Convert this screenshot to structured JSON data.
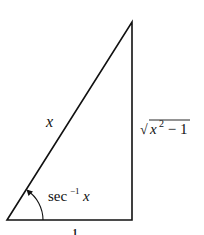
{
  "diagram": {
    "type": "right-triangle",
    "labels": {
      "hypotenuse": "x",
      "adjacent": "1",
      "opposite_radical": "√",
      "opposite_var": "x",
      "opposite_exp": "2",
      "opposite_rest": " − 1",
      "angle_func": "sec",
      "angle_exp": "−1",
      "angle_var": "x"
    },
    "colors": {
      "stroke": "#111111",
      "background": "#ffffff"
    }
  }
}
